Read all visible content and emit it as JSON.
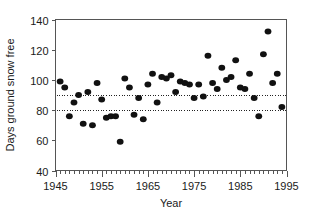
{
  "chart_data": {
    "type": "scatter",
    "title": "",
    "xlabel": "Year",
    "ylabel": "Days ground snow free",
    "xlim": [
      1945,
      1995
    ],
    "ylim": [
      40,
      140
    ],
    "grid": false,
    "legend": null,
    "x_ticks": [
      1945,
      1955,
      1965,
      1975,
      1985,
      1995
    ],
    "x_tick_labels": [
      "1945",
      "1955",
      "1965",
      "1975",
      "1985",
      "1995"
    ],
    "x_minor_tick_step": 1,
    "y_ticks": [
      40,
      60,
      80,
      100,
      120,
      140
    ],
    "y_tick_labels": [
      "40",
      "60",
      "80",
      "100",
      "120",
      "140"
    ],
    "marker": "filled-circle",
    "marker_color": "#111111",
    "marker_size_px": 6,
    "reference_lines": [
      {
        "name": "upper-reference-line",
        "y": 90,
        "style": "dotted",
        "color": "#222222"
      },
      {
        "name": "lower-reference-line",
        "y": 80,
        "style": "dotted",
        "color": "#222222"
      }
    ],
    "x": [
      1946,
      1947,
      1948,
      1949,
      1950,
      1951,
      1952,
      1953,
      1954,
      1955,
      1956,
      1957,
      1958,
      1959,
      1960,
      1961,
      1962,
      1963,
      1964,
      1965,
      1966,
      1967,
      1968,
      1969,
      1970,
      1971,
      1972,
      1973,
      1974,
      1975,
      1976,
      1977,
      1978,
      1979,
      1980,
      1981,
      1982,
      1983,
      1984,
      1985,
      1986,
      1987,
      1988,
      1989,
      1990,
      1991,
      1992,
      1993,
      1994
    ],
    "y": [
      99,
      95,
      76,
      85,
      90,
      71,
      92,
      70,
      98,
      87,
      75,
      76,
      76,
      59,
      101,
      95,
      77,
      88,
      74,
      97,
      104,
      85,
      102,
      101,
      103,
      92,
      99,
      98,
      97,
      88,
      97,
      89,
      116,
      98,
      94,
      108,
      100,
      102,
      113,
      95,
      94,
      104,
      88,
      76,
      117,
      132,
      98,
      104,
      82
    ],
    "points_count": 49,
    "y_axis_title": "Days ground snow free",
    "x_axis_title": "Year"
  },
  "figure": {
    "background_color": "#ffffff",
    "axis_color": "#555555",
    "text_color": "#1a1a1a"
  }
}
